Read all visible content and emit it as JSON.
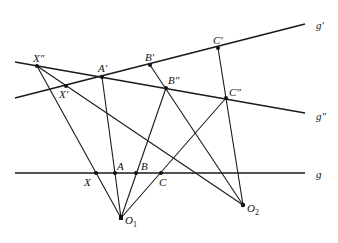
{
  "diagram": {
    "lines": {
      "g": {
        "label": "g",
        "from": [
          15,
          173
        ],
        "to": [
          305,
          173
        ]
      },
      "g_prime": {
        "label": "g′",
        "from": [
          15,
          98
        ],
        "to": [
          305,
          24
        ]
      },
      "g_double_prime": {
        "label": "g″",
        "from": [
          15,
          62
        ],
        "to": [
          305,
          113
        ]
      }
    },
    "points": {
      "X": {
        "label": "X",
        "pos": [
          96,
          173
        ]
      },
      "A": {
        "label": "A",
        "pos": [
          115,
          173
        ]
      },
      "B": {
        "label": "B",
        "pos": [
          136,
          173
        ]
      },
      "C": {
        "label": "C",
        "pos": [
          161,
          173
        ]
      },
      "X1": {
        "label": "X′",
        "pos": [
          66,
          86
        ]
      },
      "A1": {
        "label": "A′",
        "pos": [
          102,
          77
        ]
      },
      "B1": {
        "label": "B′",
        "pos": [
          150,
          65
        ]
      },
      "C1": {
        "label": "C′",
        "pos": [
          218,
          48
        ]
      },
      "X2": {
        "label": "X″",
        "pos": [
          37,
          66
        ]
      },
      "B2": {
        "label": "B″",
        "pos": [
          166,
          88
        ]
      },
      "C2": {
        "label": "C″",
        "pos": [
          226,
          98
        ]
      },
      "O1": {
        "label": "O",
        "sub": "1",
        "pos": [
          121,
          218
        ]
      },
      "O2": {
        "label": "O",
        "sub": "2",
        "pos": [
          243,
          205
        ]
      }
    }
  }
}
